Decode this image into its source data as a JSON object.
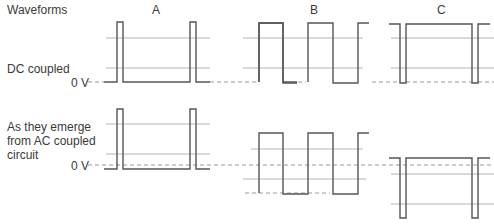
{
  "header": {
    "title": "Waveforms"
  },
  "columns": [
    "A",
    "B",
    "C"
  ],
  "rows": [
    {
      "label": "DC coupled",
      "zero_label": "0 V"
    },
    {
      "label": "As they emerge\nfrom AC coupled\ncircuit",
      "zero_label": "0 V"
    }
  ],
  "colors": {
    "trace": "#555555",
    "gridline": "#b5b5b5",
    "zero_dashed": "#9a9a9a",
    "text": "#3a3a3a"
  }
}
